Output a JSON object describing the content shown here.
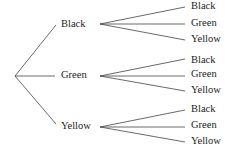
{
  "tree": {
    "level1": [
      {
        "label": "Black",
        "children": [
          "Black",
          "Green",
          "Yellow"
        ]
      },
      {
        "label": "Green",
        "children": [
          "Black",
          "Green",
          "Yellow"
        ]
      },
      {
        "label": "Yellow",
        "children": [
          "Black",
          "Green",
          "Yellow"
        ]
      }
    ]
  },
  "colors": {
    "line": "#444444",
    "text": "#222222"
  }
}
